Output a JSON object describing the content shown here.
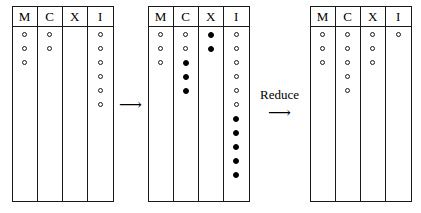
{
  "diagram": {
    "column_headers": [
      "M",
      "C",
      "X",
      "I"
    ],
    "token_types": {
      "open": "open-circle-token",
      "filled": "filled-circle-token"
    },
    "stages": [
      {
        "id": "stage-initial",
        "name": "initial-marking",
        "columns": [
          {
            "header": "M",
            "open": 3,
            "filled": 0
          },
          {
            "header": "C",
            "open": 2,
            "filled": 0
          },
          {
            "header": "X",
            "open": 0,
            "filled": 0
          },
          {
            "header": "I",
            "open": 6,
            "filled": 0
          }
        ]
      },
      {
        "id": "stage-expanded",
        "name": "expanded-marking",
        "columns": [
          {
            "header": "M",
            "open": 3,
            "filled": 0
          },
          {
            "header": "C",
            "open": 2,
            "filled": 3
          },
          {
            "header": "X",
            "open": 0,
            "filled": 2
          },
          {
            "header": "I",
            "open": 6,
            "filled": 5
          }
        ]
      },
      {
        "id": "stage-reduced",
        "name": "reduced-marking",
        "columns": [
          {
            "header": "M",
            "open": 3,
            "filled": 0
          },
          {
            "header": "C",
            "open": 5,
            "filled": 0
          },
          {
            "header": "X",
            "open": 3,
            "filled": 0
          },
          {
            "header": "I",
            "open": 1,
            "filled": 0
          }
        ]
      }
    ],
    "arrows": [
      {
        "id": "arrow-1",
        "label": "",
        "glyph": "⟶"
      },
      {
        "id": "arrow-2",
        "label": "Reduce",
        "glyph": "⟶"
      }
    ]
  }
}
